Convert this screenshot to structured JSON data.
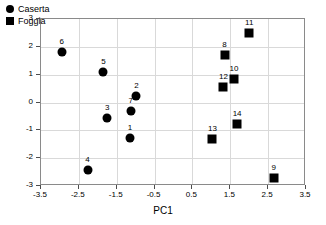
{
  "chart_data": {
    "type": "scatter",
    "title": "",
    "xlabel": "PC1",
    "ylabel": "PC2",
    "xlim": [
      -3.5,
      3.5
    ],
    "ylim": [
      -3,
      3
    ],
    "xticks": [
      "-3.5",
      "-2.5",
      "-1.5",
      "-0.5",
      "0.5",
      "1.5",
      "2.5",
      "3.5"
    ],
    "xtick_values": [
      -3.5,
      -2.5,
      -1.5,
      -0.5,
      0.5,
      1.5,
      2.5,
      3.5
    ],
    "yticks": [
      "-3",
      "-2",
      "-1",
      "0",
      "1",
      "2",
      "3"
    ],
    "ytick_values": [
      -3,
      -2,
      -1,
      0,
      1,
      2,
      3
    ],
    "grid": true,
    "legend_position": "top-left",
    "series": [
      {
        "name": "Caserta",
        "marker": "circle",
        "color": "#000000",
        "points": [
          {
            "label": "6",
            "x": -2.95,
            "y": 1.82
          },
          {
            "label": "5",
            "x": -1.85,
            "y": 1.08
          },
          {
            "label": "3",
            "x": -1.75,
            "y": -0.56
          },
          {
            "label": "4",
            "x": -2.27,
            "y": -2.42
          },
          {
            "label": "7",
            "x": -1.13,
            "y": -0.31
          },
          {
            "label": "2",
            "x": -0.98,
            "y": 0.22
          },
          {
            "label": "1",
            "x": -1.15,
            "y": -1.28
          }
        ]
      },
      {
        "name": "Foggia",
        "marker": "square",
        "color": "#000000",
        "points": [
          {
            "label": "11",
            "x": 2.0,
            "y": 2.5
          },
          {
            "label": "8",
            "x": 1.35,
            "y": 1.7
          },
          {
            "label": "10",
            "x": 1.6,
            "y": 0.85
          },
          {
            "label": "12",
            "x": 1.32,
            "y": 0.55
          },
          {
            "label": "14",
            "x": 1.68,
            "y": -0.78
          },
          {
            "label": "13",
            "x": 1.03,
            "y": -1.32
          },
          {
            "label": "9",
            "x": 2.65,
            "y": -2.7
          }
        ]
      }
    ]
  },
  "legend": {
    "items": [
      {
        "label": "Caserta",
        "marker": "circle"
      },
      {
        "label": "Foggia",
        "marker": "square"
      }
    ]
  }
}
